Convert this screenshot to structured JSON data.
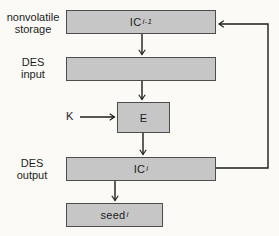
{
  "diagram": {
    "side_labels": {
      "nonvolatile_storage": {
        "line1": "nonvolatile",
        "line2": "storage"
      },
      "des_input": {
        "line1": "DES",
        "line2": "input"
      },
      "des_output": {
        "line1": "DES",
        "line2": "output"
      }
    },
    "key_label": "K",
    "boxes": {
      "ic_prev": {
        "main": "IC",
        "sub": "i-1"
      },
      "des_input_reg": {
        "main": "",
        "sub": ""
      },
      "encrypt": {
        "main": "E",
        "sub": ""
      },
      "ic_current": {
        "main": "IC",
        "sub": "i"
      },
      "seed": {
        "main": "seed",
        "sub": "i"
      }
    },
    "colors": {
      "box_fill": "#c6c6c6",
      "box_border": "#4d4d4d",
      "background": "#fbfaf6",
      "line": "#1c1c1c",
      "text": "#1c1c1c"
    }
  }
}
